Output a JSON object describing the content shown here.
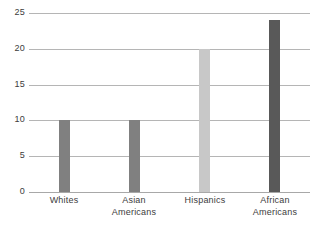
{
  "chart_data": {
    "type": "bar",
    "title": "",
    "subtitle": "",
    "xlabel": "",
    "ylabel": "",
    "categories": [
      "Whites",
      "Asian Americans",
      "Hispanics",
      "African Americans"
    ],
    "category_label_lines": [
      [
        "Whites"
      ],
      [
        "Asian",
        "Americans"
      ],
      [
        "Hispanics"
      ],
      [
        "African",
        "Americans"
      ]
    ],
    "values": [
      10,
      10,
      20,
      24
    ],
    "bar_colors": [
      "#808080",
      "#808080",
      "#c8c8c8",
      "#595959"
    ],
    "ylim": [
      0,
      25
    ],
    "ytick_values": [
      0,
      5,
      10,
      15,
      20,
      25
    ],
    "ytick_labels": [
      "0",
      "5",
      "10",
      "15",
      "20",
      "25"
    ],
    "grid": true,
    "gridline_color": "#b5b5b5",
    "axis_line_color": "#a8a8a8",
    "background_color": "#ffffff",
    "legend": null,
    "legend_position": "none",
    "annotations": []
  }
}
